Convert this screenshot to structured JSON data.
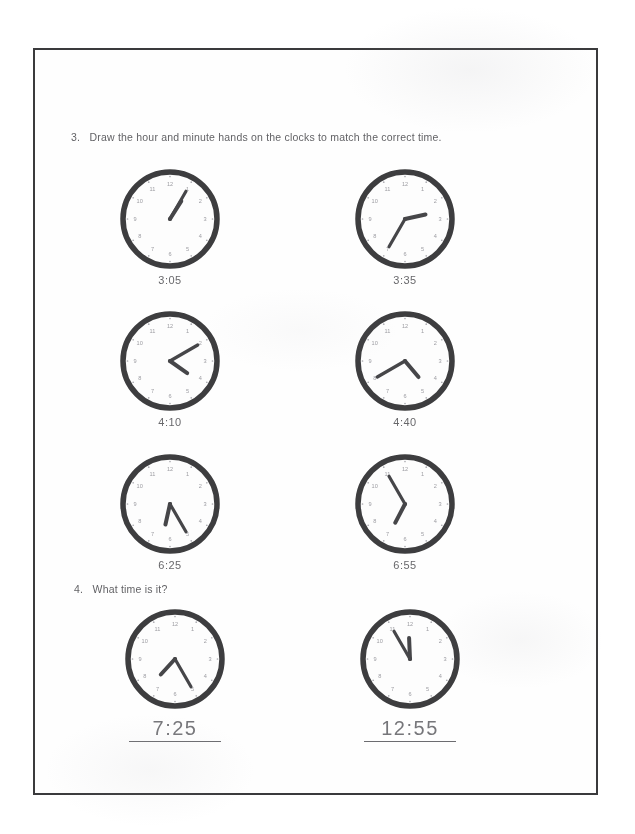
{
  "worksheet": {
    "question3": {
      "number": "3.",
      "text": "Draw the hour and minute hands on the clocks to match the correct time.",
      "clocks": [
        {
          "name": "clock-3-05",
          "label": "3:05",
          "hour_deg": 32.5,
          "minute_deg": 30,
          "numerals_shown": true
        },
        {
          "name": "clock-3-35",
          "label": "3:35",
          "hour_deg": 77.5,
          "minute_deg": 210,
          "numerals_shown": true
        },
        {
          "name": "clock-4-10",
          "label": "4:10",
          "hour_deg": 125,
          "minute_deg": 60,
          "numerals_shown": true
        },
        {
          "name": "clock-4-40",
          "label": "4:40",
          "hour_deg": 140,
          "minute_deg": 240,
          "numerals_shown": true
        },
        {
          "name": "clock-6-25",
          "label": "6:25",
          "hour_deg": 192.5,
          "minute_deg": 150,
          "numerals_shown": true
        },
        {
          "name": "clock-6-55",
          "label": "6:55",
          "hour_deg": 207.5,
          "minute_deg": 330,
          "numerals_shown": true
        }
      ]
    },
    "question4": {
      "number": "4.",
      "text": "What time is it?",
      "clocks": [
        {
          "name": "clock-answer-7-25",
          "answer": "7:25",
          "hour_deg": 222.5,
          "minute_deg": 150,
          "numerals_shown": true
        },
        {
          "name": "clock-answer-12-55",
          "answer": "12:55",
          "hour_deg": 357.5,
          "minute_deg": 330,
          "numerals_shown": true
        }
      ]
    },
    "clock_numerals": [
      "12",
      "1",
      "2",
      "3",
      "4",
      "5",
      "6",
      "7",
      "8",
      "9",
      "10",
      "11"
    ]
  },
  "colors": {
    "ink": "#3a3a3c",
    "pencil": "#55555a",
    "numeral": "#96969c",
    "page": "#fefefe",
    "border": "#3a3a3c"
  }
}
